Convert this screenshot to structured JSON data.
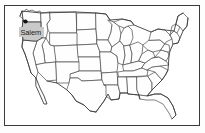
{
  "figure": {
    "type": "reference-map",
    "projection_note": "contiguous 48 states outline map",
    "frame": {
      "visible": true,
      "color": "#3a3a3a"
    },
    "background_color": "#ffffff"
  },
  "highlight": {
    "state_name": "Oregon",
    "fill_color": "#c9c9c9",
    "outline_color": "#333333"
  },
  "capital_marker": {
    "label": "Salem",
    "dot_color": "#111111",
    "label_background": "#c9c9c9",
    "label_text_color": "#1a1a1a"
  },
  "styles": {
    "state_fill": "#fefefe",
    "state_stroke": "#4a4a4a",
    "nation_stroke": "#3c3c3c"
  }
}
